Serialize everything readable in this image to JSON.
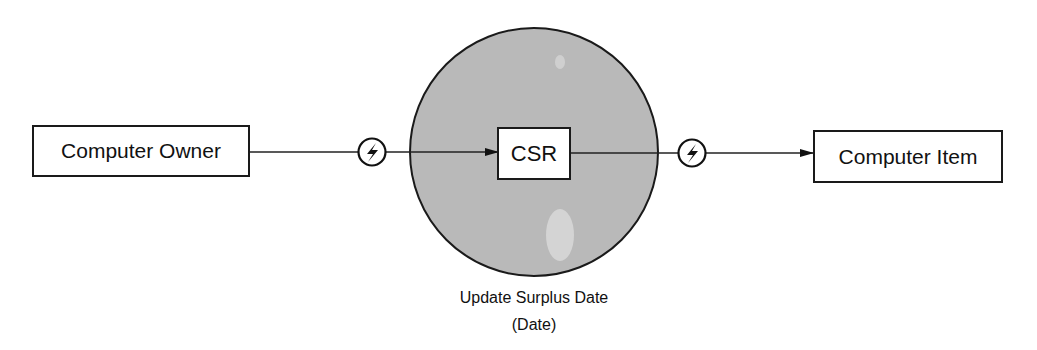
{
  "diagram": {
    "type": "event-flow",
    "nodes": {
      "source": {
        "label": "Computer Owner"
      },
      "process": {
        "label": "CSR"
      },
      "target": {
        "label": "Computer Item"
      }
    },
    "process_circle": {
      "fill": "#b8b8b8",
      "caption_line1": "Update Surplus Date",
      "caption_line2": "(Date)"
    },
    "events": [
      {
        "icon": "lightning-bolt-icon",
        "position": "between source and process"
      },
      {
        "icon": "lightning-bolt-icon",
        "position": "between process and target"
      }
    ],
    "edges": [
      {
        "from": "Computer Owner",
        "to": "CSR",
        "arrow": true
      },
      {
        "from": "CSR",
        "to": "Computer Item",
        "arrow": true
      }
    ]
  }
}
